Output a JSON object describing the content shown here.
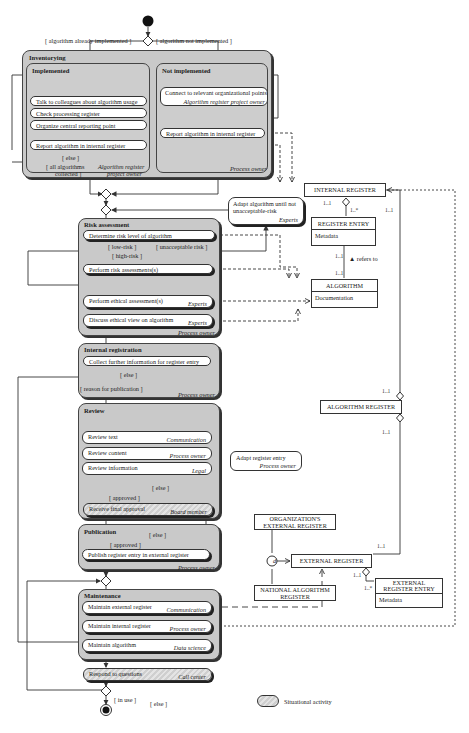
{
  "guards": {
    "already_implemented": "[ algorithm already implemented ]",
    "not_implemented": "[ algorithm not implemented ]",
    "else1": "[ else ]",
    "all_collected_1": "[ all algorithms",
    "all_collected_2": "collected ]",
    "low_risk": "[ low-risk ]",
    "unacceptable_risk": "[ unacceptable risk ]",
    "high_risk": "[ high-risk ]",
    "else_reg": "[ else ]",
    "reason_publication": "[ reason for publication ]",
    "else_review": "[ else ]",
    "approved_review": "[ approved ]",
    "else_pub": "[ else ]",
    "approved_pub": "[ approved ]",
    "in_use": "[ in use ]",
    "else_end": "[ else ]"
  },
  "inventorying": {
    "title": "Inventorying",
    "implemented": {
      "title": "Implemented",
      "activities": [
        "Talk to colleagues about algorithm usage",
        "Check processing register",
        "Organize central reporting point",
        "Report algorithm in internal register"
      ],
      "role_1": "Algorithm register",
      "role_2": "project owner"
    },
    "not_implemented": {
      "title": "Not implemented",
      "connect_1": "Connect to relevant organizational points",
      "connect_2": "Algorithm register project owner",
      "report": "Report algorithm in internal register",
      "role": "Process owner"
    }
  },
  "adapt_algorithm": {
    "line1": "Adapt algorithm until not",
    "line2": "unacceptable-risk",
    "role": "Experts"
  },
  "risk_assessment": {
    "title": "Risk assessment",
    "activities": [
      {
        "label": "Determine risk level of algorithm",
        "role": ""
      },
      {
        "label": "Perform risk assessments(s)",
        "role": ""
      },
      {
        "label": "Perform ethical assessment(s)",
        "role": "Experts"
      },
      {
        "label": "Discuss ethical view on algorithm",
        "role": "Experts"
      }
    ],
    "role": "Process owner"
  },
  "internal_registration": {
    "title": "Internal registration",
    "activity": "Collect further information for register entry",
    "role": "Process owner"
  },
  "review": {
    "title": "Review",
    "activities": [
      {
        "label": "Review text",
        "role": "Communication"
      },
      {
        "label": "Review content",
        "role": "Process owner"
      },
      {
        "label": "Review information",
        "role": "Legal"
      }
    ],
    "final": {
      "label": "Receive final approval",
      "role": "Board member"
    }
  },
  "adapt_register": {
    "label": "Adapt register entry",
    "role": "Process owner"
  },
  "publication": {
    "title": "Publication",
    "activity": "Publish register entry in external register",
    "role": "Process owner"
  },
  "maintenance": {
    "title": "Maintenance",
    "activities": [
      {
        "label": "Maintain external register",
        "role": "Communication"
      },
      {
        "label": "Maintain internal register",
        "role": "Process owner"
      },
      {
        "label": "Maintain algorithm",
        "role": "Data science"
      }
    ]
  },
  "respond": {
    "label": "Respond to questions",
    "role": "Call center"
  },
  "classes": {
    "internal_register": "INTERNAL REGISTER",
    "register_entry": {
      "name": "REGISTER ENTRY",
      "attr": "Metadata"
    },
    "algorithm": {
      "name": "ALGORITHM",
      "attr": "Documentation"
    },
    "refers_to": "▲ refers to",
    "algorithm_register": "ALGORITHM REGISTER",
    "org_external_1": "ORGANIZATION'S",
    "org_external_2": "EXTERNAL REGISTER",
    "external_register": "EXTERNAL REGISTER",
    "national_1": "NATIONAL ALGORITHM",
    "national_2": "REGISTER",
    "ext_entry_1": "EXTERNAL",
    "ext_entry_2": "REGISTER ENTRY",
    "ext_entry_attr": "Metadata",
    "disjoint": "d"
  },
  "multiplicities": {
    "ir_agg": "1..1",
    "re_many": "1..*",
    "ir_right": "1..1",
    "re_alg": "1..1",
    "alg_re": "1..1",
    "ar_top": "1..1",
    "ar_bottom": "1..1",
    "er_right": "1..1",
    "er_entry_1": "1..1",
    "er_entry_many": "1..*"
  },
  "legend": {
    "label": "Situational activity"
  }
}
